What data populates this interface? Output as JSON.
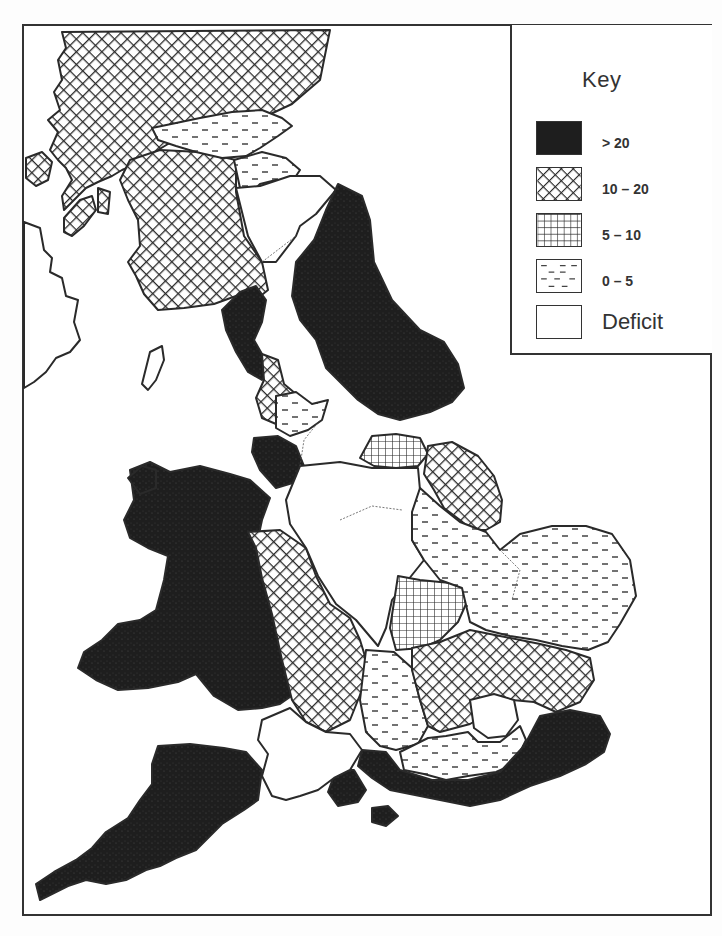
{
  "map": {
    "title_cut_off": "",
    "subject": "Regional values by region of Great Britain",
    "key": {
      "title": "Key",
      "items": [
        {
          "id": "gt20",
          "label": "> 20",
          "pattern": "solid-dark",
          "color": "#1e1e1e"
        },
        {
          "id": "10-20",
          "label": "10 – 20",
          "pattern": "crosshatch-diagonal",
          "color": "#2a2a2a"
        },
        {
          "id": "5-10",
          "label": "5 – 10",
          "pattern": "grid-square",
          "color": "#2a2a2a"
        },
        {
          "id": "0-5",
          "label": "0 – 5",
          "pattern": "dashes",
          "color": "#444444"
        },
        {
          "id": "deficit",
          "label": "Deficit",
          "pattern": "blank",
          "color": "#ffffff"
        }
      ]
    },
    "regions": [
      {
        "name": "Scottish Highlands",
        "class": "10-20"
      },
      {
        "name": "Strathclyde / South-West Scotland",
        "class": "10-20"
      },
      {
        "name": "Central Scotland",
        "class": "0-5"
      },
      {
        "name": "Lothian / Borders",
        "class": "0-5"
      },
      {
        "name": "North-East England",
        "class": "gt20"
      },
      {
        "name": "Yorkshire",
        "class": "gt20"
      },
      {
        "name": "Cumbria",
        "class": "gt20"
      },
      {
        "name": "Lancashire",
        "class": "10-20"
      },
      {
        "name": "Merseyside",
        "class": "gt20"
      },
      {
        "name": "Greater Manchester",
        "class": "0-5"
      },
      {
        "name": "Humberside",
        "class": "5-10"
      },
      {
        "name": "Lincolnshire",
        "class": "10-20"
      },
      {
        "name": "Wales",
        "class": "gt20"
      },
      {
        "name": "West Midlands",
        "class": "10-20"
      },
      {
        "name": "Staffordshire area",
        "class": "0-5"
      },
      {
        "name": "East Midlands",
        "class": "deficit"
      },
      {
        "name": "Northamptonshire",
        "class": "5-10"
      },
      {
        "name": "East Anglia",
        "class": "0-5"
      },
      {
        "name": "Oxfordshire area",
        "class": "0-5"
      },
      {
        "name": "Home Counties",
        "class": "10-20"
      },
      {
        "name": "Greater London",
        "class": "deficit"
      },
      {
        "name": "Thames corridor",
        "class": "0-5"
      },
      {
        "name": "South-East England",
        "class": "gt20"
      },
      {
        "name": "Hampshire / Isle of Wight",
        "class": "gt20"
      },
      {
        "name": "Avon / Wiltshire",
        "class": "deficit"
      },
      {
        "name": "South-West England",
        "class": "gt20"
      },
      {
        "name": "Northern Ireland",
        "class": "deficit"
      },
      {
        "name": "Isle of Man",
        "class": "deficit"
      }
    ]
  }
}
